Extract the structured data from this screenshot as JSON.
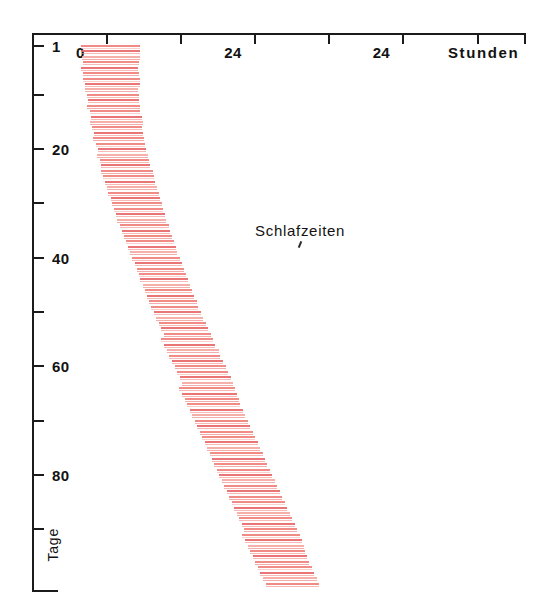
{
  "chart_data": {
    "type": "bar",
    "title": "",
    "subtitle": "",
    "xlabel": "Stunden",
    "ylabel": "Tage",
    "grid": false,
    "legend": null,
    "plot_style": "double-plotted actogram",
    "x_axis": {
      "name": "Stunden",
      "tick_labels": [
        "0",
        "24",
        "24"
      ],
      "tick_label_hours": [
        0,
        24,
        48
      ],
      "minor_tick_interval_hours": 12,
      "range_hours": [
        -8,
        72
      ],
      "unit": "hours"
    },
    "y_axis": {
      "name": "Tage",
      "tick_labels": [
        "1",
        "20",
        "40",
        "60",
        "80"
      ],
      "tick_label_days": [
        1,
        20,
        40,
        60,
        80
      ],
      "unlabeled_tick_days": [
        10,
        30,
        50,
        70,
        90
      ],
      "range_days": [
        1,
        100
      ],
      "unit": "days",
      "direction": "top-to-bottom"
    },
    "annotations": [
      {
        "text": "Schlafzeiten",
        "day": 33,
        "hour": 33,
        "pointer": true
      }
    ],
    "colors": {
      "bar": "#f0817c",
      "bar_dark": "#e8696a",
      "bar_pale": "#f6a9a2",
      "axis": "#1b1b1b",
      "text": "#121212",
      "background": "#ffffff"
    },
    "series_name": "Schlafzeiten",
    "episodes": [
      {
        "day": 1,
        "start": 0.0,
        "end": 9.6
      },
      {
        "day": 2,
        "start": 0.1,
        "end": 9.5
      },
      {
        "day": 3,
        "start": 0.2,
        "end": 9.6
      },
      {
        "day": 4,
        "start": 0.3,
        "end": 9.4
      },
      {
        "day": 5,
        "start": 0.0,
        "end": 9.3
      },
      {
        "day": 6,
        "start": 0.4,
        "end": 9.4
      },
      {
        "day": 7,
        "start": 0.3,
        "end": 9.6
      },
      {
        "day": 8,
        "start": 0.6,
        "end": 9.5
      },
      {
        "day": 9,
        "start": 0.7,
        "end": 9.2
      },
      {
        "day": 10,
        "start": 0.9,
        "end": 9.3
      },
      {
        "day": 11,
        "start": 1.2,
        "end": 9.4
      },
      {
        "day": 12,
        "start": 1.0,
        "end": 9.6
      },
      {
        "day": 13,
        "start": 1.4,
        "end": 9.5
      },
      {
        "day": 14,
        "start": 1.6,
        "end": 9.8
      },
      {
        "day": 15,
        "start": 1.5,
        "end": 10.0
      },
      {
        "day": 16,
        "start": 1.8,
        "end": 9.9
      },
      {
        "day": 17,
        "start": 2.1,
        "end": 10.1
      },
      {
        "day": 18,
        "start": 2.0,
        "end": 10.3
      },
      {
        "day": 19,
        "start": 2.4,
        "end": 10.4
      },
      {
        "day": 20,
        "start": 2.8,
        "end": 10.6
      },
      {
        "day": 21,
        "start": 2.6,
        "end": 10.8
      },
      {
        "day": 22,
        "start": 3.0,
        "end": 11.0
      },
      {
        "day": 23,
        "start": 3.3,
        "end": 11.2
      },
      {
        "day": 24,
        "start": 3.2,
        "end": 11.6
      },
      {
        "day": 25,
        "start": 3.6,
        "end": 11.8
      },
      {
        "day": 26,
        "start": 3.9,
        "end": 12.0
      },
      {
        "day": 27,
        "start": 4.2,
        "end": 12.3
      },
      {
        "day": 28,
        "start": 4.4,
        "end": 12.6
      },
      {
        "day": 29,
        "start": 4.8,
        "end": 12.8
      },
      {
        "day": 30,
        "start": 5.0,
        "end": 13.1
      },
      {
        "day": 31,
        "start": 5.4,
        "end": 13.4
      },
      {
        "day": 32,
        "start": 5.6,
        "end": 13.6
      },
      {
        "day": 33,
        "start": 5.9,
        "end": 13.9
      },
      {
        "day": 34,
        "start": 6.3,
        "end": 14.2
      },
      {
        "day": 35,
        "start": 6.6,
        "end": 14.4
      },
      {
        "day": 36,
        "start": 7.0,
        "end": 14.8
      },
      {
        "day": 37,
        "start": 7.3,
        "end": 15.1
      },
      {
        "day": 38,
        "start": 7.6,
        "end": 15.3
      },
      {
        "day": 39,
        "start": 8.0,
        "end": 15.6
      },
      {
        "day": 40,
        "start": 8.3,
        "end": 16.0
      },
      {
        "day": 41,
        "start": 8.7,
        "end": 16.3
      },
      {
        "day": 42,
        "start": 9.0,
        "end": 16.6
      },
      {
        "day": 43,
        "start": 9.4,
        "end": 17.0
      },
      {
        "day": 44,
        "start": 9.6,
        "end": 17.3
      },
      {
        "day": 45,
        "start": 10.0,
        "end": 17.6
      },
      {
        "day": 46,
        "start": 10.4,
        "end": 18.0
      },
      {
        "day": 47,
        "start": 10.7,
        "end": 18.3
      },
      {
        "day": 48,
        "start": 11.0,
        "end": 18.7
      },
      {
        "day": 49,
        "start": 11.4,
        "end": 19.0
      },
      {
        "day": 50,
        "start": 11.8,
        "end": 19.4
      },
      {
        "day": 51,
        "start": 12.2,
        "end": 19.8
      },
      {
        "day": 52,
        "start": 12.6,
        "end": 20.2
      },
      {
        "day": 53,
        "start": 13.0,
        "end": 20.6
      },
      {
        "day": 54,
        "start": 13.4,
        "end": 21.0
      },
      {
        "day": 55,
        "start": 13.0,
        "end": 21.4
      },
      {
        "day": 56,
        "start": 13.5,
        "end": 21.8
      },
      {
        "day": 57,
        "start": 13.9,
        "end": 22.3
      },
      {
        "day": 58,
        "start": 14.3,
        "end": 22.6
      },
      {
        "day": 59,
        "start": 14.8,
        "end": 23.0
      },
      {
        "day": 60,
        "start": 15.2,
        "end": 23.4
      },
      {
        "day": 61,
        "start": 15.6,
        "end": 23.8
      },
      {
        "day": 62,
        "start": 16.0,
        "end": 24.2
      },
      {
        "day": 63,
        "start": 16.4,
        "end": 24.6
      },
      {
        "day": 64,
        "start": 15.9,
        "end": 25.0
      },
      {
        "day": 65,
        "start": 16.3,
        "end": 25.2
      },
      {
        "day": 66,
        "start": 16.8,
        "end": 25.5
      },
      {
        "day": 67,
        "start": 17.2,
        "end": 25.8
      },
      {
        "day": 68,
        "start": 17.6,
        "end": 26.2
      },
      {
        "day": 69,
        "start": 18.0,
        "end": 26.6
      },
      {
        "day": 70,
        "start": 18.4,
        "end": 27.0
      },
      {
        "day": 71,
        "start": 18.8,
        "end": 27.4
      },
      {
        "day": 72,
        "start": 19.2,
        "end": 27.8
      },
      {
        "day": 73,
        "start": 19.6,
        "end": 28.2
      },
      {
        "day": 74,
        "start": 20.0,
        "end": 28.6
      },
      {
        "day": 75,
        "start": 20.4,
        "end": 29.0
      },
      {
        "day": 76,
        "start": 20.8,
        "end": 29.4
      },
      {
        "day": 77,
        "start": 21.2,
        "end": 29.8
      },
      {
        "day": 78,
        "start": 21.6,
        "end": 30.2
      },
      {
        "day": 79,
        "start": 22.0,
        "end": 30.6
      },
      {
        "day": 80,
        "start": 22.4,
        "end": 31.0
      },
      {
        "day": 81,
        "start": 22.8,
        "end": 31.4
      },
      {
        "day": 82,
        "start": 23.2,
        "end": 31.8
      },
      {
        "day": 83,
        "start": 23.6,
        "end": 32.2
      },
      {
        "day": 84,
        "start": 24.0,
        "end": 32.6
      },
      {
        "day": 85,
        "start": 24.4,
        "end": 33.0
      },
      {
        "day": 86,
        "start": 24.8,
        "end": 33.4
      },
      {
        "day": 87,
        "start": 25.2,
        "end": 33.8
      },
      {
        "day": 88,
        "start": 25.6,
        "end": 34.2
      },
      {
        "day": 89,
        "start": 26.0,
        "end": 34.6
      },
      {
        "day": 90,
        "start": 26.4,
        "end": 35.0
      },
      {
        "day": 91,
        "start": 26.0,
        "end": 35.4
      },
      {
        "day": 92,
        "start": 26.5,
        "end": 35.8
      },
      {
        "day": 93,
        "start": 27.0,
        "end": 36.0
      },
      {
        "day": 94,
        "start": 27.4,
        "end": 36.3
      },
      {
        "day": 95,
        "start": 27.8,
        "end": 36.6
      },
      {
        "day": 96,
        "start": 28.2,
        "end": 37.0
      },
      {
        "day": 97,
        "start": 28.6,
        "end": 37.4
      },
      {
        "day": 98,
        "start": 29.0,
        "end": 37.8
      },
      {
        "day": 99,
        "start": 29.4,
        "end": 38.2
      },
      {
        "day": 100,
        "start": 30.0,
        "end": 38.6
      }
    ]
  },
  "geometry": {
    "frame_left_px": 32,
    "frame_top_px": 33,
    "frame_right_px": 526,
    "frame_bottom_px": 592,
    "hour0_x_px": 81,
    "px_per_hour": 6.18,
    "day1_y_px": 45,
    "px_per_day": 5.43
  }
}
